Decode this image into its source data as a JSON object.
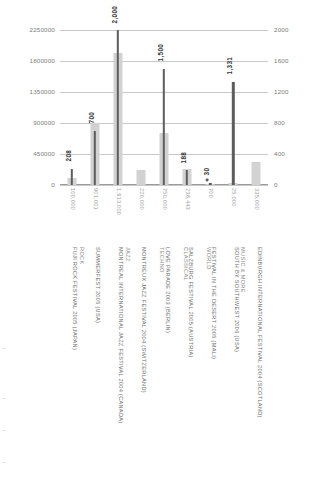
{
  "chart_data": {
    "type": "bar",
    "title": "",
    "subtitle": "",
    "xlabel": "",
    "ylabel": "",
    "grid": true,
    "legend": "none",
    "categories": [
      "FUJI ROCK FESTIVAL 2005 (JAPAN)",
      "SUMMERFEST 2005 (USA)",
      "MONTREAL INTERNATIONAL JAZZ FESTIVAL 2004 (CANADA)",
      "MONTREUX JAZZ FESTIVAL 2004 (SWITZERLAND)",
      "LOVE PARADE 2003 (BERLIN)",
      "SALZBURG FESTIVAL 2005 (AUSTRIA)",
      "FESTIVAL IN THE DESERT 2005 (MALI)",
      "SOUTH BY SOUTHWEST 2006 (USA)",
      "EDINBURGH INTERNATIONAL FESTIVAL 2004 (SCOTLAND)"
    ],
    "groups": [
      {
        "label": "ROCK",
        "span": 2
      },
      {
        "label": "JAZZ",
        "span": 2
      },
      {
        "label": "TECHNO",
        "span": 1
      },
      {
        "label": "CLASSICAL",
        "span": 1
      },
      {
        "label": "WORLD",
        "span": 1
      },
      {
        "label": "MUSIC & MORE",
        "span": 2
      }
    ],
    "series": [
      {
        "name": "attendance",
        "axis": "left",
        "color": "#d2d2d2",
        "values": [
          100000,
          901001,
          1913000,
          220000,
          750000,
          238443,
          700,
          25000,
          335000
        ],
        "value_labels": [
          "100,000",
          "901,001",
          "1,913,000",
          "220,000",
          "750,000",
          "238,443",
          "700",
          "25,000",
          "335,000"
        ]
      },
      {
        "name": "performers",
        "axis": "right",
        "color": "#5d5d5d",
        "values": [
          208,
          700,
          2000,
          null,
          1500,
          188,
          30,
          1331,
          null
        ],
        "value_labels": [
          "208",
          "700",
          "2,000",
          "",
          "1,500",
          "188",
          "30",
          "1,331",
          ""
        ]
      }
    ],
    "left_axis": {
      "ticks": [
        0,
        450000,
        900000,
        1350000,
        1800000,
        2250000
      ],
      "tick_labels": [
        "0",
        "450000",
        "900000",
        "1350000",
        "1800000",
        "2250000"
      ],
      "min": 0,
      "max": 2250000
    },
    "right_axis": {
      "ticks": [
        0,
        400,
        800,
        1200,
        1600,
        2000
      ],
      "tick_labels": [
        "0",
        "400",
        "800",
        "1200",
        "1600",
        "2000"
      ],
      "min": 0,
      "max": 2000
    }
  }
}
